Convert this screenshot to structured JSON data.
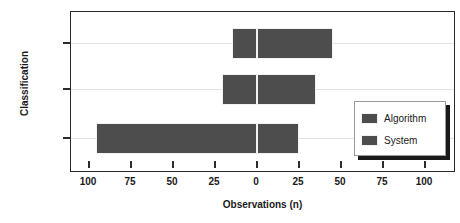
{
  "chart_data": {
    "type": "bar",
    "orientation": "horizontal",
    "layout": "diverging",
    "title": "",
    "xlabel": "Observations (n)",
    "ylabel": "Classification",
    "categories": [
      "MoS",
      "MoE",
      "MoP"
    ],
    "xticks": [
      100,
      75,
      50,
      25,
      0,
      25,
      50,
      75,
      100
    ],
    "xtick_labels": [
      "100",
      "75",
      "50",
      "25",
      "0",
      "25",
      "50",
      "75",
      "100"
    ],
    "xlim": [
      -110,
      110
    ],
    "grid": true,
    "grid_axis": "y",
    "legend_position": "right-lower",
    "series": [
      {
        "name": "Algorithm",
        "direction": "left",
        "values": [
          15,
          21,
          96
        ]
      },
      {
        "name": "System",
        "direction": "right",
        "values": [
          45,
          35,
          25
        ]
      }
    ],
    "colors": {
      "bar": "#4d4d4d",
      "frame": "#2b2b2b",
      "grid": "#e2e2e2",
      "text": "#1a1a1a",
      "background": "#ffffff"
    }
  },
  "legend": {
    "entries": [
      {
        "label": "Algorithm"
      },
      {
        "label": "System"
      }
    ]
  }
}
